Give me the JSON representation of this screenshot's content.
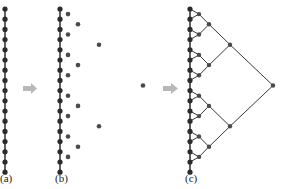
{
  "figure": {
    "panels": [
      {
        "id": "a",
        "label": "(a)",
        "description": "Vertical chain of 17 connected nodes"
      },
      {
        "id": "b",
        "label": "(b)",
        "description": "Chain with hierarchical unconnected nodes placed to the right"
      },
      {
        "id": "c",
        "label": "(c)",
        "description": "Chain with binary-tree hierarchy connected by edges"
      }
    ],
    "arrows": [
      "arrow-a-to-b",
      "arrow-b-to-c"
    ],
    "colors": {
      "node": "#2b2b2b",
      "edge": "#3a3a3a",
      "arrow": "#b8b8b8",
      "secondary_node": "#4a4a4a"
    },
    "chain_nodes": 17,
    "chain_y_start": 9,
    "chain_y_step": 10.2
  }
}
